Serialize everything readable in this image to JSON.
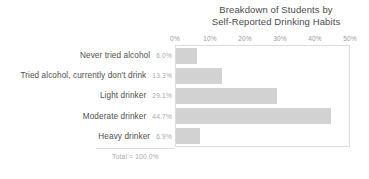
{
  "chart_data": {
    "type": "bar",
    "orientation": "horizontal",
    "title": "Breakdown of Students by Self-Reported Drinking Habits",
    "title_lines": [
      "Breakdown of Students by",
      "Self-Reported Drinking Habits"
    ],
    "categories": [
      "Never tried alcohol",
      "Tried alcohol, currently don't drink",
      "Light drinker",
      "Moderate drinker",
      "Heavy drinker"
    ],
    "values": [
      6.0,
      13.3,
      29.1,
      44.7,
      6.9
    ],
    "value_labels": [
      "6.0%",
      "13.3%",
      "29.1%",
      "44.7%",
      "6.9%"
    ],
    "xlabel": "",
    "ylabel": "",
    "xlim": [
      0,
      50
    ],
    "xticks": [
      0,
      10,
      20,
      30,
      40,
      50
    ],
    "xtick_labels": [
      "0%",
      "10%",
      "20%",
      "30%",
      "40%",
      "50%"
    ],
    "grid": false,
    "legend": null,
    "bar_color": "#d2d2d2",
    "plot_border_color": "#dcdcdc",
    "annotation": "Total = 100.0%"
  },
  "footer": {
    "total_label": "Total = 100.0%"
  }
}
